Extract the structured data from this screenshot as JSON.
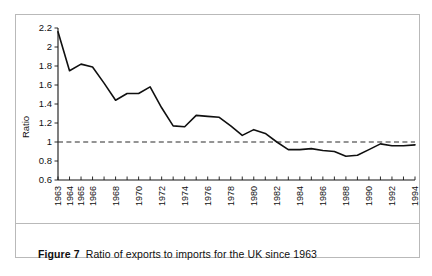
{
  "figure": {
    "caption_label": "Figure 7",
    "caption_text": "Ratio of exports to imports for the UK since 1963"
  },
  "colors": {
    "line": "#101010",
    "reference_line": "#2a2a2a",
    "axis": "#151515",
    "frame": "#b9b9b9",
    "background": "#ffffff"
  },
  "chart_data": {
    "type": "line",
    "title": "",
    "xlabel": "",
    "ylabel": "Ratio",
    "xlim": [
      1963,
      1994
    ],
    "ylim": [
      0.6,
      2.2
    ],
    "grid": false,
    "legend": null,
    "y_ticks": [
      "2.2",
      "2",
      "1.8",
      "1.6",
      "1.4",
      "1.2",
      "1",
      "0.8",
      "0.6"
    ],
    "y_tick_values": [
      2.2,
      2,
      1.8,
      1.6,
      1.4,
      1.2,
      1,
      0.8,
      0.6
    ],
    "x_tick_values": [
      1963,
      1964,
      1965,
      1966,
      1967,
      1968,
      1969,
      1970,
      1971,
      1972,
      1973,
      1974,
      1975,
      1976,
      1977,
      1978,
      1979,
      1980,
      1981,
      1982,
      1983,
      1984,
      1985,
      1986,
      1987,
      1988,
      1989,
      1990,
      1991,
      1992,
      1993,
      1994
    ],
    "x_tick_labels": [
      "1963",
      "1964",
      "1965",
      "1966",
      "",
      "1968",
      "",
      "1970",
      "",
      "1972",
      "",
      "1974",
      "",
      "1976",
      "",
      "1978",
      "",
      "1980",
      "",
      "1982",
      "",
      "1984",
      "",
      "1986",
      "",
      "1988",
      "",
      "1990",
      "",
      "1992",
      "",
      "1994"
    ],
    "annotations": [
      {
        "type": "reference_line",
        "axis": "y",
        "value": 1.0,
        "style": "dashed"
      }
    ],
    "x": [
      1963,
      1964,
      1965,
      1966,
      1967,
      1968,
      1969,
      1970,
      1971,
      1972,
      1973,
      1974,
      1975,
      1976,
      1977,
      1978,
      1979,
      1980,
      1981,
      1982,
      1983,
      1984,
      1985,
      1986,
      1987,
      1988,
      1989,
      1990,
      1991,
      1992,
      1993,
      1994
    ],
    "values": [
      2.16,
      1.75,
      1.82,
      1.79,
      1.62,
      1.44,
      1.51,
      1.51,
      1.58,
      1.36,
      1.17,
      1.16,
      1.28,
      1.27,
      1.26,
      1.17,
      1.07,
      1.13,
      1.09,
      1.0,
      0.92,
      0.92,
      0.93,
      0.91,
      0.9,
      0.85,
      0.86,
      0.92,
      0.98,
      0.96,
      0.96,
      0.97
    ],
    "series": [
      {
        "name": "Ratio of exports to imports",
        "values": [
          2.16,
          1.75,
          1.82,
          1.79,
          1.62,
          1.44,
          1.51,
          1.51,
          1.58,
          1.36,
          1.17,
          1.16,
          1.28,
          1.27,
          1.26,
          1.17,
          1.07,
          1.13,
          1.09,
          1.0,
          0.92,
          0.92,
          0.93,
          0.91,
          0.9,
          0.85,
          0.86,
          0.92,
          0.98,
          0.96,
          0.96,
          0.97
        ]
      }
    ]
  }
}
